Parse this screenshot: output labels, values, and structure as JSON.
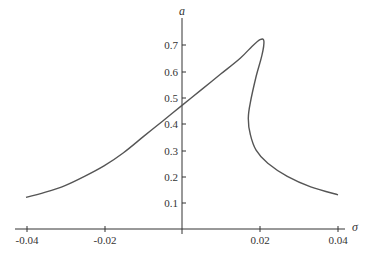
{
  "chart_data": {
    "type": "line",
    "title": "",
    "xlabel": "σ",
    "ylabel": "a",
    "xlim": [
      -0.04,
      0.04
    ],
    "ylim": [
      0,
      0.75
    ],
    "grid": false,
    "legend": null,
    "x_ticks": [
      "-0.04",
      "-0.02",
      "0.02",
      "0.04"
    ],
    "y_ticks": [
      "0.1",
      "0.2",
      "0.3",
      "0.4",
      "0.5",
      "0.6",
      "0.7"
    ],
    "series": [
      {
        "name": "frequency-response",
        "points": [
          [
            -0.04,
            0.12
          ],
          [
            -0.035,
            0.14
          ],
          [
            -0.03,
            0.165
          ],
          [
            -0.025,
            0.2
          ],
          [
            -0.02,
            0.24
          ],
          [
            -0.015,
            0.29
          ],
          [
            -0.01,
            0.35
          ],
          [
            -0.005,
            0.41
          ],
          [
            0.0,
            0.47
          ],
          [
            0.005,
            0.53
          ],
          [
            0.01,
            0.59
          ],
          [
            0.015,
            0.65
          ],
          [
            0.018,
            0.695
          ],
          [
            0.02,
            0.72
          ],
          [
            0.021,
            0.715
          ],
          [
            0.0205,
            0.66
          ],
          [
            0.019,
            0.58
          ],
          [
            0.0175,
            0.48
          ],
          [
            0.017,
            0.42
          ],
          [
            0.0175,
            0.36
          ],
          [
            0.019,
            0.3
          ],
          [
            0.022,
            0.25
          ],
          [
            0.027,
            0.2
          ],
          [
            0.033,
            0.16
          ],
          [
            0.04,
            0.13
          ]
        ]
      }
    ]
  },
  "axes": {
    "x_title": "σ",
    "y_title": "a",
    "x_tick_labels": [
      "-0.04",
      "-0.02",
      "0.02",
      "0.04"
    ],
    "y_tick_labels": [
      "0.1",
      "0.2",
      "0.3",
      "0.4",
      "0.5",
      "0.6",
      "0.7"
    ]
  },
  "colors": {
    "curve": "#555555",
    "axis": "#333333"
  }
}
